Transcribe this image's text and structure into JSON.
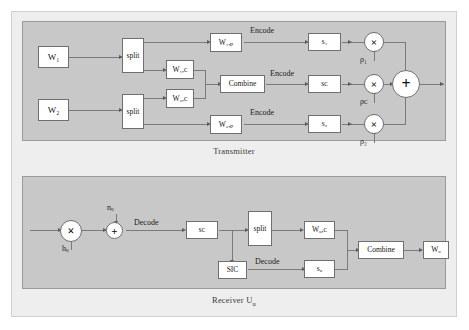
{
  "figure": {
    "type": "block-diagram",
    "background": "#ffffff",
    "panel_fill": "#c8c8c8",
    "frame_fill": "#eeeeee",
    "node_fill": "#ffffff",
    "line_color": "#7a7a7a"
  },
  "transmitter": {
    "caption": "Transmitter",
    "nodes": {
      "w1": "W₁",
      "w2": "W₂",
      "split1": "split",
      "split2": "split",
      "w1c": "W₁,ᴄ",
      "w2c": "W₂,ᴄ",
      "w1p": "W₁,ₚ",
      "w2p": "W₂,ₚ",
      "combine": "Combine",
      "s1": "s₁",
      "sc": "sᴄ",
      "s2": "s₂",
      "mult1": "×",
      "multc": "×",
      "mult2": "×",
      "sum": "+"
    },
    "edge_labels": {
      "encode1": "Encode",
      "encodec": "Encode",
      "encode2": "Encode"
    },
    "gain_labels": {
      "rho1": "ρ₁",
      "rhoc": "ρᴄ",
      "rho2": "ρ₂"
    }
  },
  "receiver": {
    "caption_prefix": "Receiver U",
    "caption_sub": "u",
    "nodes": {
      "mult": "×",
      "adder": "+",
      "sc": "sᴄ",
      "split": "split",
      "sic": "SIC",
      "wuc": "Wᵤ,ᴄ",
      "su": "sᵤ",
      "combine": "Combine",
      "wu": "Wᵤ"
    },
    "edge_labels": {
      "decode_top": "Decode",
      "decode_bottom": "Decode"
    },
    "signal_labels": {
      "channel": "hᵤ",
      "noise": "nᵤ"
    }
  }
}
